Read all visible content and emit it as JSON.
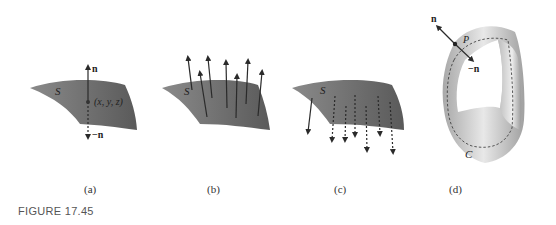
{
  "figure": {
    "label": "FIGURE 17.45",
    "panels": [
      {
        "id": "a",
        "caption": "(a)",
        "surface_label": "S",
        "point_label": "(x, y, z)",
        "normal_up": "n",
        "normal_down": "−n"
      },
      {
        "id": "b",
        "caption": "(b)",
        "surface_label": "S"
      },
      {
        "id": "c",
        "caption": "(c)",
        "surface_label": "S"
      },
      {
        "id": "d",
        "caption": "(d)",
        "normal_label": "n",
        "neg_normal_label": "−n",
        "point_label": "P",
        "curve_label": "C"
      }
    ]
  },
  "colors": {
    "surface": "#6e6e6e",
    "surface_dark": "#555555",
    "arrow": "#2a2a2a",
    "mobius_light": "#e4e4e4",
    "mobius_dark": "#a8a8a8"
  }
}
